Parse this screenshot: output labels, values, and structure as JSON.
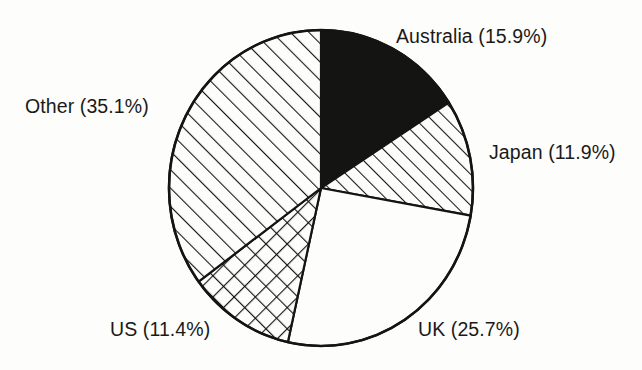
{
  "figure": {
    "background_color": "#fdfdfc",
    "text_color": "#1a1a18",
    "outline_color": "#141412"
  },
  "chart_data": {
    "type": "pie",
    "title": "",
    "subtitle": "",
    "xlabel": "",
    "ylabel": "",
    "legend_position": "none",
    "grid": false,
    "labels_inline": true,
    "start_angle_deg": 0,
    "direction": "clockwise",
    "center": {
      "x": 321,
      "y": 188
    },
    "radius_x": 152,
    "radius_y": 158,
    "categories": [
      "Australia",
      "Japan",
      "UK",
      "US",
      "Other"
    ],
    "values": [
      15.9,
      11.9,
      25.7,
      11.4,
      35.1
    ],
    "units": "percent",
    "total": 100.0,
    "slices": [
      {
        "name": "Australia",
        "value": 15.9,
        "value_text": "15.9%",
        "label": "Australia (15.9%)",
        "fill": "solid-black",
        "fill_color": "#141412",
        "start_deg": 0.0,
        "end_deg": 57.24
      },
      {
        "name": "Japan",
        "value": 11.9,
        "value_text": "11.9%",
        "label": "Japan (11.9%)",
        "fill": "diagonal-hatch-forward",
        "fill_color": "#fdfdfc",
        "start_deg": 57.24,
        "end_deg": 100.08
      },
      {
        "name": "UK",
        "value": 25.7,
        "value_text": "25.7%",
        "label": "UK (25.7%)",
        "fill": "blank-white",
        "fill_color": "#fdfdfc",
        "start_deg": 100.08,
        "end_deg": 192.6
      },
      {
        "name": "US",
        "value": 11.4,
        "value_text": "11.4%",
        "label": "US (11.4%)",
        "fill": "cross-hatch",
        "fill_color": "#fdfdfc",
        "start_deg": 192.6,
        "end_deg": 233.64
      },
      {
        "name": "Other",
        "value": 35.1,
        "value_text": "35.1%",
        "label": "Other (35.1%)",
        "fill": "diagonal-hatch-forward-wide",
        "fill_color": "#fdfdfc",
        "start_deg": 233.64,
        "end_deg": 360.0
      }
    ]
  },
  "labels": {
    "australia": "Australia (15.9%)",
    "japan": "Japan (11.9%)",
    "uk": "UK (25.7%)",
    "us": "US (11.4%)",
    "other": "Other (35.1%)"
  }
}
